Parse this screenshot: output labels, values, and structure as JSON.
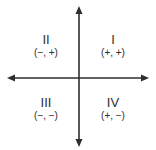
{
  "diagram": {
    "title": "",
    "type": "coordinate-plane-quadrants",
    "line_color": "#2e2e2e",
    "text_color": "#2e2e2e",
    "background": "#ffffff",
    "axes": {
      "horizontal": {
        "arrow_left": true,
        "arrow_right": true
      },
      "vertical": {
        "arrow_up": true,
        "arrow_down": true
      }
    },
    "quadrants": {
      "q1": {
        "numeral": "I",
        "signs": "(+, +)"
      },
      "q2": {
        "numeral": "II",
        "signs": "(−, +)"
      },
      "q3": {
        "numeral": "III",
        "signs": "(−, −)"
      },
      "q4": {
        "numeral": "IV",
        "signs": "(+, −)"
      }
    }
  }
}
